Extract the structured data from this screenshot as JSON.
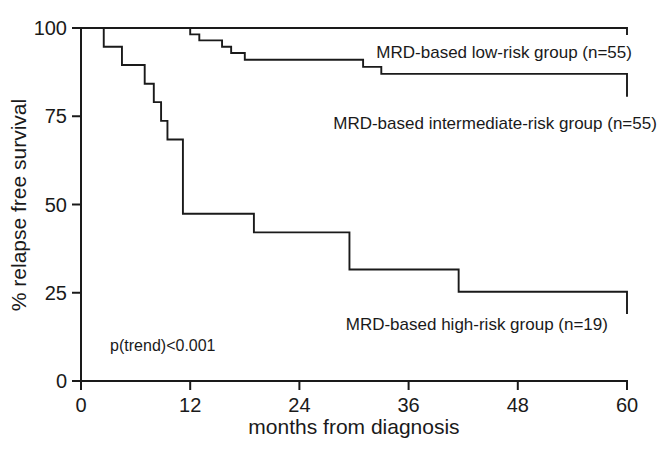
{
  "chart_data": {
    "type": "line",
    "title": "",
    "subtitle": "",
    "xlabel": "months from diagnosis",
    "ylabel": "% relapse free survival",
    "xlim": [
      0,
      60
    ],
    "ylim": [
      0,
      100
    ],
    "xticks": [
      0,
      12,
      24,
      36,
      48,
      60
    ],
    "yticks": [
      0,
      25,
      50,
      75,
      100
    ],
    "xtick_labels": [
      "0",
      "12",
      "24",
      "36",
      "48",
      "60"
    ],
    "ytick_labels": [
      "0",
      "25",
      "50",
      "75",
      "100"
    ],
    "grid": false,
    "legend_position": "inline-right-of-curves",
    "step_style": "post",
    "annotations": [
      {
        "name": "p-value",
        "text": "p(trend)<0.001",
        "x": 3.2,
        "y": 8.5
      }
    ],
    "series": [
      {
        "name": "MRD-based low-risk group (n=55)",
        "label": "MRD-based low-risk group (n=55)",
        "n": 55,
        "color": "#1a1a1a",
        "label_x": 46.5,
        "label_y": 91.5,
        "x": [
          0,
          18,
          60
        ],
        "y": [
          100,
          100,
          98
        ]
      },
      {
        "name": "MRD-based intermediate-risk group (n=55)",
        "label": "MRD-based intermediate-risk group (n=55)",
        "n": 55,
        "color": "#1a1a1a",
        "label_x": 45.5,
        "label_y": 71.5,
        "x": [
          0,
          11,
          12,
          13,
          14.5,
          15.5,
          16.5,
          18,
          29,
          31,
          33,
          60
        ],
        "y": [
          100,
          100,
          98.2,
          96.5,
          96.5,
          94.7,
          92.9,
          91,
          91,
          89,
          87,
          80.5
        ]
      },
      {
        "name": "MRD-based high-risk group (n=19)",
        "label": "MRD-based high-risk group (n=19)",
        "n": 19,
        "color": "#1a1a1a",
        "label_x": 43.5,
        "label_y": 14.5,
        "x": [
          0,
          1.2,
          2.5,
          4.5,
          6,
          7,
          8,
          8.8,
          9.5,
          10.4,
          11.2,
          19,
          21,
          29.5,
          41.5,
          60
        ],
        "y": [
          100,
          100,
          94.7,
          89.5,
          89.5,
          84.2,
          79,
          73.7,
          68.4,
          68.4,
          47.4,
          42.1,
          42.1,
          31.6,
          25.3,
          19
        ]
      }
    ]
  },
  "figure": {
    "background_color": "#ffffff",
    "axis_color": "#1a1a1a"
  }
}
